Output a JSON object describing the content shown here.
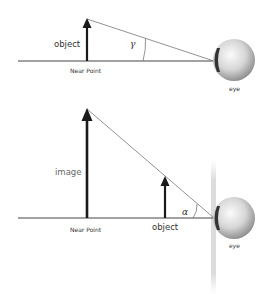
{
  "top_panel": {
    "object_label": "object",
    "near_point_label": "Near Point",
    "angle_label": "γ",
    "eye_label": "eye"
  },
  "bottom_panel": {
    "image_label": "image",
    "near_point_label": "Near Point",
    "object_label": "object",
    "angle_label": "α",
    "eye_label": "eye"
  },
  "colors": {
    "arrow": "#1a1a1a",
    "axis": "#444444",
    "ray": "#777777",
    "eye_light": "#f2f2f2",
    "eye_dark": "#8a8a8a",
    "lens_band": "#d9d9d9"
  }
}
